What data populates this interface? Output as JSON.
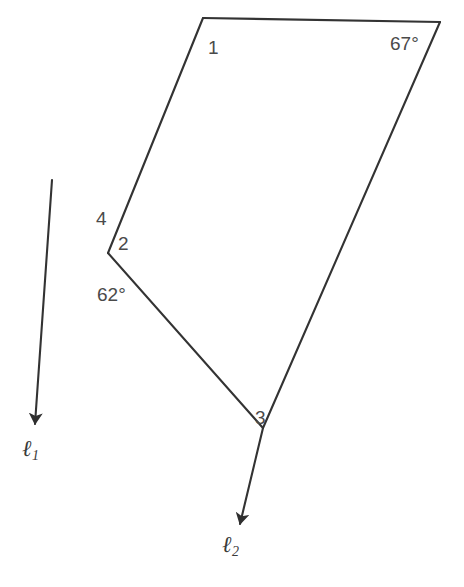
{
  "figure": {
    "type": "geometry-diagram",
    "background_color": "#ffffff",
    "stroke_color": "#333333",
    "label_color": "#4a4a4a",
    "width": 464,
    "height": 587,
    "angle_labels": [
      {
        "id": "angle-1",
        "text": "1",
        "x": 208,
        "y": 38
      },
      {
        "id": "angle-67",
        "text": "67°",
        "x": 390,
        "y": 34
      },
      {
        "id": "angle-4",
        "text": "4",
        "x": 96,
        "y": 209
      },
      {
        "id": "angle-2",
        "text": "2",
        "x": 118,
        "y": 234
      },
      {
        "id": "angle-62",
        "text": "62°",
        "x": 97,
        "y": 285
      },
      {
        "id": "angle-3",
        "text": "3",
        "x": 255,
        "y": 408
      }
    ],
    "line_labels": [
      {
        "id": "line-l1",
        "name": "ℓ",
        "subscript": "1",
        "x": 22,
        "y": 437
      },
      {
        "id": "line-l2",
        "name": "ℓ",
        "subscript": "2",
        "x": 222,
        "y": 533
      }
    ],
    "vertices": {
      "top_left": {
        "x": 203,
        "y": 18
      },
      "top_right": {
        "x": 440,
        "y": 22
      },
      "intersection": {
        "x": 108,
        "y": 253
      },
      "vertex_3": {
        "x": 263,
        "y": 428
      },
      "l1_start": {
        "x": 52,
        "y": 180
      },
      "l1_arrow_tip": {
        "x": 33,
        "y": 428
      },
      "l2_arrow_tip": {
        "x": 242,
        "y": 527
      }
    },
    "paths": {
      "top_edge": "M 203 18 L 440 22",
      "right_edge": "M 440 22 L 263 428",
      "left_edge": "M 203 18 L 108 253",
      "l2_mid_segment": "M 108 253 L 263 428",
      "l2_tail": "M 263 428 L 240 524",
      "l1_segment": "M 52 180 L 35 424"
    }
  }
}
